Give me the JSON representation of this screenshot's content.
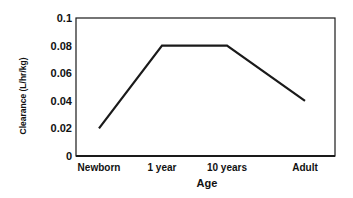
{
  "chart_data": {
    "type": "line",
    "title": "",
    "xlabel": "Age",
    "ylabel": "Clearance (L/hr/kg)",
    "categories": [
      "Newborn",
      "1 year",
      "10 years",
      "Adult"
    ],
    "series": [
      {
        "name": "Clearance",
        "values": [
          0.02,
          0.08,
          0.08,
          0.04
        ]
      }
    ],
    "ylim": [
      0,
      0.1
    ],
    "yticks": [
      0,
      0.02,
      0.04,
      0.06,
      0.08,
      0.1
    ],
    "ytick_labels": [
      "0",
      "0.02",
      "0.04",
      "0.06",
      "0.08",
      "0.1"
    ],
    "grid": false,
    "legend": null,
    "colors": {
      "line": "#1a1a1a",
      "frame": "#1a1a1a",
      "background": "#ffffff"
    }
  }
}
